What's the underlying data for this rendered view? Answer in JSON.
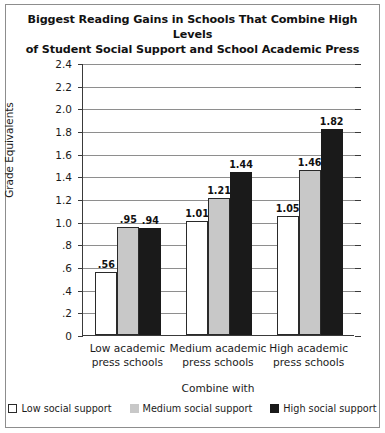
{
  "chart_data": {
    "type": "bar",
    "title": "Biggest Reading Gains in Schools That Combine High Levels of Student Social Support and School Academic Press",
    "title_lines": [
      "Biggest Reading Gains in Schools That Combine High Levels",
      "of Student Social Support and School Academic Press"
    ],
    "xlabel": "Combine with",
    "ylabel": "One-Year Achievement Gains in Grade Equivalents",
    "ylabel_lines": [
      "One-Year Achievement Gains in",
      "Grade Equivalents"
    ],
    "categories": [
      "Low academic press schools",
      "Medium academic press schools",
      "High academic press schools"
    ],
    "category_lines": [
      [
        "Low academic",
        "press schools"
      ],
      [
        "Medium academic",
        "press schools"
      ],
      [
        "High academic",
        "press schools"
      ]
    ],
    "series": [
      {
        "name": "Low social support",
        "color": "#ffffff",
        "values": [
          0.56,
          1.01,
          1.05
        ],
        "labels": [
          ".56",
          "1.01",
          "1.05"
        ]
      },
      {
        "name": "Medium social support",
        "color": "#c8c8c8",
        "values": [
          0.95,
          1.21,
          1.46
        ],
        "labels": [
          ".95",
          "1.21",
          "1.46"
        ]
      },
      {
        "name": "High social support",
        "color": "#1a1a1a",
        "values": [
          0.94,
          1.44,
          1.82
        ],
        "labels": [
          ".94",
          "1.44",
          "1.82"
        ]
      }
    ],
    "ylim": [
      0,
      2.4
    ],
    "ytick_values": [
      0,
      0.2,
      0.4,
      0.6,
      0.8,
      1.0,
      1.2,
      1.4,
      1.6,
      1.8,
      2.0,
      2.2,
      2.4
    ],
    "ytick_labels": [
      "0",
      ".2",
      ".4",
      ".6",
      ".8",
      "1.0",
      "1.2",
      "1.4",
      "1.6",
      "1.8",
      "2.0",
      "2.2",
      "2.4"
    ],
    "grid": true,
    "legend_position": "bottom"
  }
}
